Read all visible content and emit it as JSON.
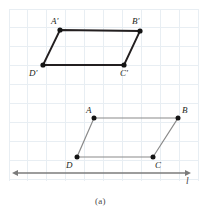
{
  "figure": {
    "caption": "(a)",
    "width": 206,
    "height": 215,
    "background_color": "#ffffff"
  },
  "grid": {
    "visible": true,
    "spacing": 18.9,
    "color": "#e8eef3",
    "x_start": 9,
    "x_end": 198,
    "y_start": 9,
    "y_end": 181
  },
  "line_l": {
    "label": "l",
    "color": "#7b7b7b",
    "y": 173,
    "x_start": 12,
    "x_end": 191,
    "arrow_left": true,
    "arrow_right": true,
    "label_x": 186,
    "label_y": 177
  },
  "image_shape": {
    "name": "A'B'C'D'",
    "stroke_color": "#231f20",
    "stroke_width": 1.9,
    "dot_color": "#141414",
    "dot_radius": 2.6,
    "vertices": [
      {
        "id": "A-prime",
        "label": "A'",
        "x": 60,
        "y": 30,
        "label_x": 51,
        "label_y": 17
      },
      {
        "id": "B-prime",
        "label": "B'",
        "x": 140,
        "y": 31,
        "label_x": 132,
        "label_y": 17
      },
      {
        "id": "C-prime",
        "label": "C'",
        "x": 124,
        "y": 65,
        "label_x": 120,
        "label_y": 69
      },
      {
        "id": "D-prime",
        "label": "D'",
        "x": 43,
        "y": 65,
        "label_x": 29,
        "label_y": 69
      }
    ]
  },
  "preimage_shape": {
    "name": "ABCD",
    "stroke_color": "#8a8a8a",
    "stroke_width": 1.2,
    "dot_color": "#141414",
    "dot_radius": 2.5,
    "vertices": [
      {
        "id": "A",
        "label": "A",
        "x": 94,
        "y": 118,
        "label_x": 86,
        "label_y": 106
      },
      {
        "id": "B",
        "label": "B",
        "x": 178,
        "y": 118,
        "label_x": 182,
        "label_y": 106
      },
      {
        "id": "C",
        "label": "C",
        "x": 153,
        "y": 157,
        "label_x": 155,
        "label_y": 161
      },
      {
        "id": "D",
        "label": "D",
        "x": 77,
        "y": 157,
        "label_x": 66,
        "label_y": 161
      }
    ]
  },
  "caption": {
    "text": "(a)",
    "x": 95,
    "y": 197
  }
}
